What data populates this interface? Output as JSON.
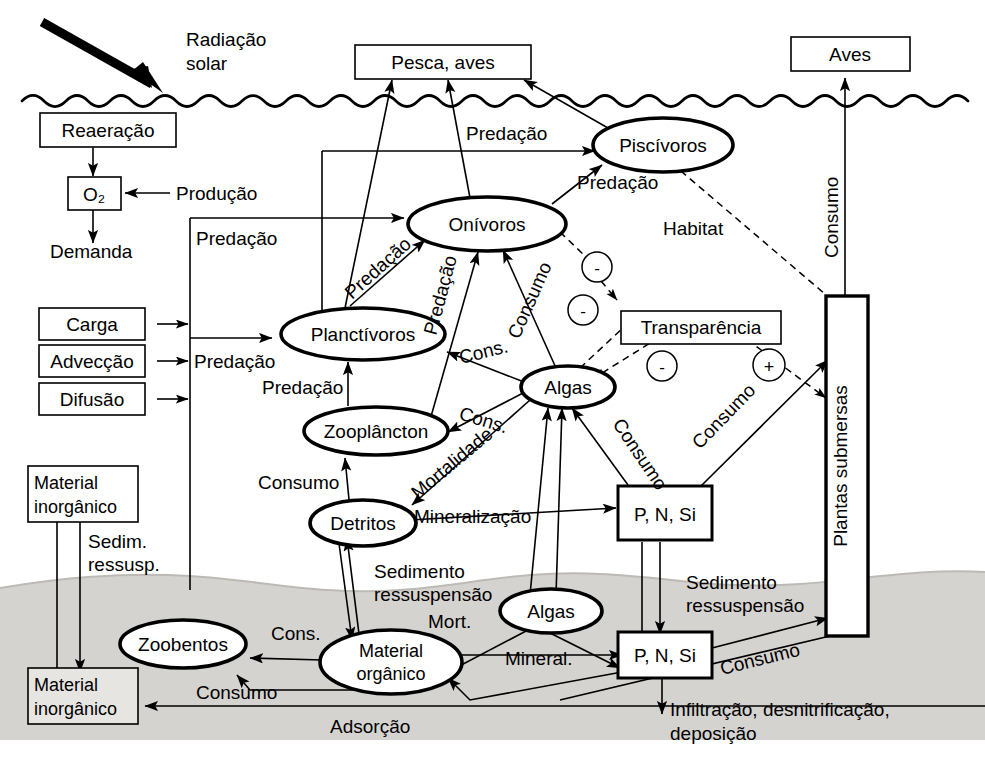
{
  "diagram": {
    "colors": {
      "background": "#ffffff",
      "sediment": "#d4d2cf",
      "stroke": "#000000"
    },
    "zones": {
      "water_surface_label": "linha d'agua ondulada",
      "sediment_label": "camada de sedimento"
    }
  },
  "external_boxes": [
    {
      "id": "pesca_aves",
      "label": "Pesca, aves"
    },
    {
      "id": "aves",
      "label": "Aves"
    },
    {
      "id": "reaeracao",
      "label": "Reaeração"
    },
    {
      "id": "o2",
      "label": "O₂"
    },
    {
      "id": "carga",
      "label": "Carga"
    },
    {
      "id": "adveccao",
      "label": "Advecção"
    },
    {
      "id": "difusao",
      "label": "Difusão"
    },
    {
      "id": "material_inorganico_top",
      "line1": "Material",
      "line2": "inorgânico"
    },
    {
      "id": "material_inorganico_bottom",
      "line1": "Material",
      "line2": "inorgânico"
    },
    {
      "id": "transparencia",
      "label": "Transparência"
    },
    {
      "id": "pnsi_water",
      "label": "P, N, Si"
    },
    {
      "id": "pnsi_sediment",
      "label": "P, N, Si"
    },
    {
      "id": "plantas_submersas",
      "label": "Plantas submersas"
    }
  ],
  "compartments": [
    {
      "id": "piscivoros",
      "label": "Piscívoros"
    },
    {
      "id": "onivoros",
      "label": "Onívoros"
    },
    {
      "id": "planctivoros",
      "label": "Planctívoros"
    },
    {
      "id": "zooplancton",
      "label": "Zooplâncton"
    },
    {
      "id": "algas_water",
      "label": "Algas"
    },
    {
      "id": "detritos",
      "label": "Detritos"
    },
    {
      "id": "zoobentos",
      "label": "Zoobentos"
    },
    {
      "id": "algas_sediment",
      "label": "Algas"
    },
    {
      "id": "material_organico",
      "line1": "Material",
      "line2": "orgânico"
    }
  ],
  "flow_labels": {
    "radiacao_solar_1": "Radiação",
    "radiacao_solar_2": "solar",
    "producao": "Produção",
    "demanda": "Demanda",
    "predacao_piscivoros": "Predação",
    "predacao_onivoros": "Predação",
    "predacao_left": "Predação",
    "predacao_carga": "Predação",
    "predacao_planctivoros": "Predação",
    "predacao_diag_1": "Predação",
    "predacao_diag_2": "Predação",
    "habitat": "Habitat",
    "consumo_onivoros_algas": "Consumo",
    "consumo_aves": "Consumo",
    "cons_algas_planctivoros": "Cons.",
    "cons_algas_zooplancton": "Cons.",
    "consumo_zooplancton_detritos": "Consumo",
    "mortalidade": "Mortalidade",
    "mineralizacao": "Mineralização",
    "consumo_algas_pnsi": "Consumo",
    "consumo_plantas_pnsi": "Consumo",
    "sedim_ressusp_1": "Sedim.",
    "sedim_ressusp_2": "ressusp.",
    "sedimento_ressuspensao_left_1": "Sedimento",
    "sedimento_ressuspensao_left_2": "ressuspensão",
    "sedimento_ressuspensao_right_1": "Sedimento",
    "sedimento_ressuspensao_right_2": "ressuspensão",
    "mort": "Mort.",
    "cons_zoobentos": "Cons.",
    "consumo_zoobentos": "Consumo",
    "mineral": "Mineral.",
    "adsorcao": "Adsorção",
    "consumo_plantas_sediment": "Consumo",
    "infiltracao_1": "Infiltração, desnitrificação,",
    "infiltracao_2": "deposição"
  },
  "sign_markers": [
    {
      "id": "minus-1",
      "symbol": "-"
    },
    {
      "id": "minus-2",
      "symbol": "-"
    },
    {
      "id": "minus-3",
      "symbol": "-"
    },
    {
      "id": "plus-1",
      "symbol": "+"
    }
  ]
}
